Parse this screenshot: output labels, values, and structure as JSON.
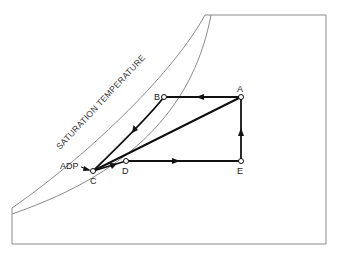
{
  "diagram": {
    "type": "psychrometric-process-diagram",
    "curve_label": "SATURATION TEMPERATURE",
    "points": {
      "A": {
        "label": "A"
      },
      "B": {
        "label": "B"
      },
      "C": {
        "label": "C"
      },
      "D": {
        "label": "D"
      },
      "E": {
        "label": "E"
      }
    },
    "annotation": {
      "label": "ADP"
    },
    "colors": {
      "frame": "#8a8a8a",
      "process_line": "#111111",
      "dashed_line": "#333333"
    }
  }
}
